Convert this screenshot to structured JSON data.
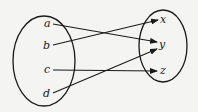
{
  "diagram": {
    "type": "mapping",
    "colors": {
      "background": "#f4f4f2",
      "stroke": "#1a1a1a"
    },
    "domain_set": {
      "elements": [
        {
          "label": "a",
          "x": 47,
          "y": 27
        },
        {
          "label": "b",
          "x": 46,
          "y": 49
        },
        {
          "label": "c",
          "x": 47,
          "y": 73
        },
        {
          "label": "d",
          "x": 46,
          "y": 97
        }
      ]
    },
    "codomain_set": {
      "elements": [
        {
          "label": "x",
          "x": 163,
          "y": 23
        },
        {
          "label": "y",
          "x": 162,
          "y": 48
        },
        {
          "label": "z",
          "x": 163,
          "y": 74
        }
      ]
    },
    "mapping": [
      {
        "from": "a",
        "to": "y"
      },
      {
        "from": "b",
        "to": "x"
      },
      {
        "from": "c",
        "to": "z"
      },
      {
        "from": "d",
        "to": "y"
      }
    ]
  }
}
